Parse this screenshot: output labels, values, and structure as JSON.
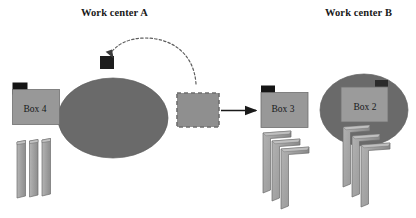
{
  "diagram": {
    "type": "process-flow",
    "canvas": {
      "width": 416,
      "height": 218,
      "background": "#ffffff"
    },
    "titles": {
      "work_center_a": "Work center A",
      "work_center_b": "Work center B"
    },
    "boxes": [
      {
        "id": "box4",
        "label": "Box 4",
        "tab": "top-left",
        "tab_color": "#151515",
        "fill": "#989898"
      },
      {
        "id": "box3",
        "label": "Box 3",
        "tab": "top-left",
        "tab_color": "#151515",
        "fill": "#989898"
      },
      {
        "id": "box2",
        "label": "Box 2",
        "tab": "top-right",
        "tab_color": "#2b2b2b",
        "fill": "#9b9b9b"
      }
    ],
    "queue_box": {
      "label": "",
      "style": "dashed",
      "fill": "#8f8f8f",
      "border_color": "#707070"
    },
    "work_centers": [
      {
        "id": "wc-a",
        "shape": "ellipse",
        "fill": "#6a6a6a",
        "tab": "top-center",
        "tab_color": "#1d1d1d"
      },
      {
        "id": "wc-b",
        "shape": "ellipse",
        "fill": "#6a6a6a",
        "tab": "none"
      }
    ],
    "connectors": [
      {
        "id": "feedback-arrow",
        "style": "dashed-curve",
        "from": "queue-box-top",
        "to": "work-center-a-tab",
        "color": "#5e5e5e"
      },
      {
        "id": "transfer-arrow",
        "style": "solid-straight",
        "from": "queue-box",
        "to": "box3",
        "color": "#1a1a1a"
      }
    ],
    "part_stacks": [
      {
        "id": "stack-box4",
        "shape": "flat-sheet",
        "count": 3,
        "fill": "#a0a0a0"
      },
      {
        "id": "stack-box3",
        "shape": "bent-angle",
        "count": 3,
        "fill": "#a0a0a0"
      },
      {
        "id": "stack-box2",
        "shape": "bent-angle",
        "count": 3,
        "fill": "#a0a0a0"
      }
    ],
    "colors": {
      "work_center_fill": "#6a6a6a",
      "box_fill": "#989898",
      "part_fill": "#a0a0a0",
      "tab_dark": "#151515",
      "outline": "#5a5a5a",
      "text": "#17181a"
    }
  }
}
